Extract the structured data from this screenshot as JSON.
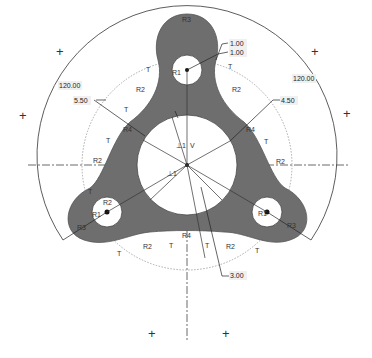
{
  "sketch": {
    "colors": {
      "part_fill": "#6e6e6e",
      "hole_fill": "#ffffff",
      "construction_line": "#444444",
      "dotted_circle": "#aaaaaa",
      "dimension_line": "#222222",
      "background": "#ffffff"
    },
    "dimensions": [
      {
        "id": "d1",
        "value": "1.00"
      },
      {
        "id": "d2",
        "value": "1.00"
      },
      {
        "id": "d3",
        "value": "120.00"
      },
      {
        "id": "d4",
        "value": "120.00"
      },
      {
        "id": "d5",
        "value": "5.50"
      },
      {
        "id": "d6",
        "value": "4.50"
      },
      {
        "id": "d7",
        "value": "3.00"
      }
    ],
    "constraint_labels": {
      "tangent": "T",
      "r1": "R1",
      "r2": "R2",
      "r3": "R3",
      "r4": "R4",
      "vertical": "V",
      "perpendicular": "⊥1"
    },
    "markers": {
      "plus": "+"
    }
  }
}
